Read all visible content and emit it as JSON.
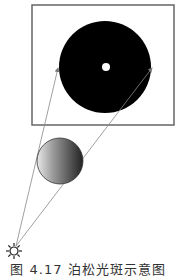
{
  "figure": {
    "caption": "图 4.17  泊松光斑示意图",
    "screen": {
      "x": 32,
      "y": 5,
      "width": 142,
      "height": 120,
      "stroke": "#666666",
      "fill": "#ffffff"
    },
    "shadow_disk": {
      "cx": 105,
      "cy": 67,
      "r": 46,
      "fill": "#000000"
    },
    "poisson_spot": {
      "cx": 106,
      "cy": 67,
      "r": 4,
      "fill": "#ffffff"
    },
    "obstacle_sphere": {
      "cx": 60,
      "cy": 161,
      "r": 23,
      "light": "#e6e6e6",
      "dark": "#2a2a2a"
    },
    "light_source": {
      "cx": 14,
      "cy": 251,
      "label": "point-light-source"
    },
    "rays": [
      {
        "x1": 16,
        "y1": 246,
        "x2": 58,
        "y2": 68
      },
      {
        "x1": 16,
        "y1": 246,
        "x2": 152,
        "y2": 68
      }
    ],
    "ray_color": "#888888"
  }
}
